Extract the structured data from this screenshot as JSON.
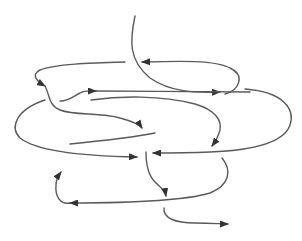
{
  "diagram": {
    "type": "knot-like curved arrow diagram",
    "background": "#ffffff",
    "stroke_color": "#5a5a5a",
    "arrow_color": "#333333",
    "labels": [],
    "paths": [
      {
        "id": "top-stem",
        "d": "M135,16 C130,40 128,60 150,78 C170,92 195,93 220,92",
        "arrow_end": true
      },
      {
        "id": "top-loop-return",
        "d": "M225,94 C240,90 245,75 230,68 C215,60 180,61 142,62",
        "arrow_end": true
      },
      {
        "id": "upper-left-hook",
        "d": "M125,62 C90,63 55,64 40,70 C30,75 38,82 45,86",
        "arrow_end": true
      },
      {
        "id": "upper-small-s",
        "d": "M60,101 C70,101 75,95 80,93 C85,90 90,91 96,91",
        "arrow_end": true
      },
      {
        "id": "upper-long-right",
        "d": "M96,91 C150,91 190,92 250,92",
        "arrow_end": false
      },
      {
        "id": "left-descending-s",
        "d": "M45,86 C50,95 48,105 60,110 C75,116 100,112 120,118 C135,122 140,125 142,128",
        "arrow_end": true
      },
      {
        "id": "mid-right-loop",
        "d": "M245,89 C285,92 295,110 290,125 C285,140 260,150 210,152 C185,153 165,153 153,153",
        "arrow_end": true
      },
      {
        "id": "mid-inner-curve",
        "d": "M91,100 C120,96 160,95 195,104 C215,110 222,120 220,130 C218,138 215,142 212,146",
        "arrow_end": true
      },
      {
        "id": "big-left-loop",
        "d": "M45,100 C15,110 10,128 20,138 C35,150 80,156 137,157",
        "arrow_end": true
      },
      {
        "id": "mid-short-left",
        "d": "M70,144 C100,141 130,138 155,133",
        "arrow_end": false
      },
      {
        "id": "center-down-stem",
        "d": "M146,152 C146,165 148,175 155,182 C160,187 165,190 166,196",
        "arrow_end": true
      },
      {
        "id": "right-lower-swoop",
        "d": "M222,158 C232,170 230,185 210,193 C180,202 120,203 70,203",
        "arrow_end": true
      },
      {
        "id": "left-up-hook",
        "d": "M70,203 C60,205 55,196 56,185 C56,180 58,176 61,172",
        "arrow_end": true
      },
      {
        "id": "bottom-tail",
        "d": "M164,208 C163,218 175,223 195,223 C210,223 222,224 228,224",
        "arrow_end": true
      }
    ]
  }
}
